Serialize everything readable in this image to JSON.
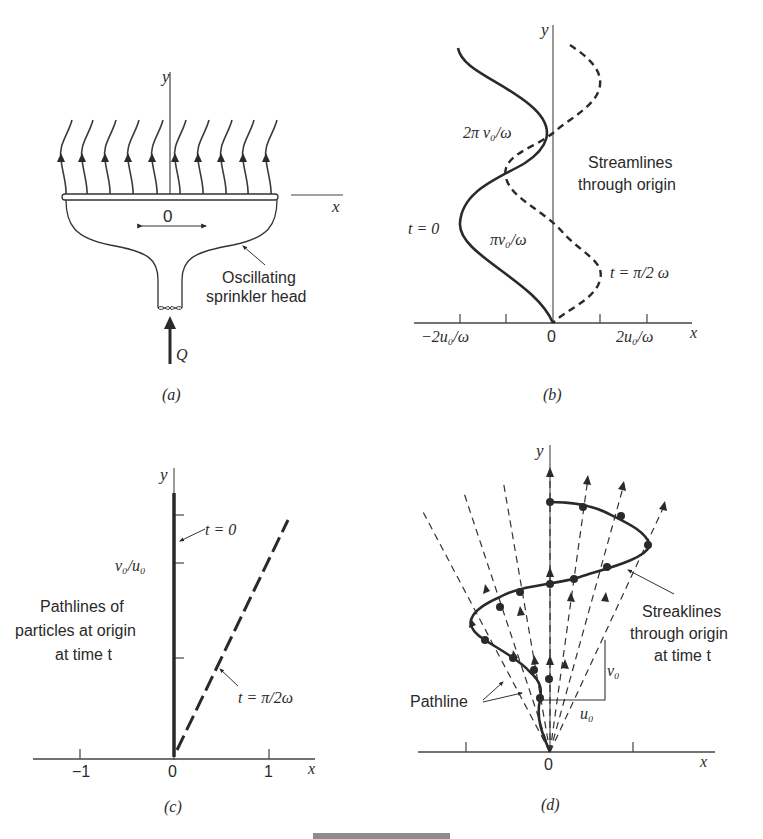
{
  "panels": {
    "a": {
      "caption": "(a)",
      "axis_x": "x",
      "axis_y": "y",
      "origin": "0",
      "flow_label": "Q",
      "annotation_line1": "Oscillating",
      "annotation_line2": "sprinkler head",
      "num_streamlines": 10
    },
    "b": {
      "caption": "(b)",
      "axis_x": "x",
      "axis_y": "y",
      "tick_left": "−2u₀/ω",
      "tick_origin": "0",
      "tick_right": "2u₀/ω",
      "label_2pi": "2π v₀/ω",
      "label_pi": "πv₀/ω",
      "label_t0": "t = 0",
      "label_tpi": "t = π/2 ω",
      "annotation_line1": "Streamlines",
      "annotation_line2": "through origin"
    },
    "c": {
      "caption": "(c)",
      "axis_x": "x",
      "axis_y": "y",
      "tick_neg1": "−1",
      "tick_0": "0",
      "tick_1": "1",
      "ytick_label": "v₀/u₀",
      "label_t0": "t = 0",
      "label_tpi": "t = π/2ω",
      "annotation_line1": "Pathlines of",
      "annotation_line2": "particles at origin",
      "annotation_line3": "at time t"
    },
    "d": {
      "caption": "(d)",
      "axis_x": "x",
      "axis_y": "y",
      "origin": "0",
      "label_v0": "v₀",
      "label_u0": "u₀",
      "pathline_label": "Pathline",
      "annotation_line1": "Streaklines",
      "annotation_line2": "through origin",
      "annotation_line3": "at time t"
    }
  }
}
